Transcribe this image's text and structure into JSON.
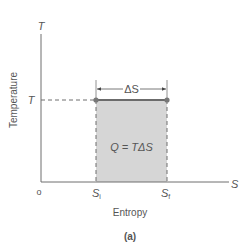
{
  "figure": {
    "panel_label": "(a)",
    "y_axis": {
      "symbol": "T",
      "title": "Temperature",
      "tick_label": "T"
    },
    "x_axis": {
      "symbol": "S",
      "title": "Entropy",
      "origin_label": "o",
      "tick_initial": "S",
      "tick_initial_sub": "i",
      "tick_final": "S",
      "tick_final_sub": "f"
    },
    "interval_label": "ΔS",
    "area_label": "Q = TΔS",
    "colors": {
      "axis": "#6e6e6e",
      "shade": "#d6d6d6",
      "process_line": "#6b6b6b",
      "point": "#777777"
    }
  }
}
